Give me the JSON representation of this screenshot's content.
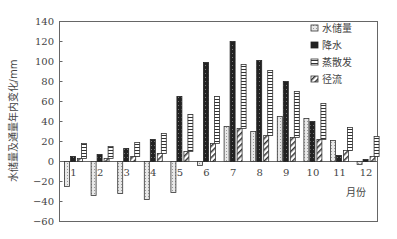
{
  "chart_data": {
    "type": "bar",
    "title": "",
    "xlabel": "月份",
    "ylabel": "水储量及通量年内变化/mm",
    "ylim": [
      -60,
      140
    ],
    "yticks": [
      140,
      120,
      100,
      80,
      60,
      40,
      20,
      0,
      -20,
      -40,
      -60
    ],
    "grid": false,
    "legend_position": "upper right",
    "categories": [
      "1",
      "2",
      "3",
      "4",
      "5",
      "6",
      "7",
      "8",
      "9",
      "10",
      "11",
      "12"
    ],
    "series": [
      {
        "name": "水储量",
        "pattern": "dotted-light",
        "values": [
          -25,
          -34,
          -32,
          -38,
          -31,
          -4,
          35,
          30,
          45,
          43,
          21,
          -3
        ]
      },
      {
        "name": "降水",
        "pattern": "dark",
        "values": [
          5,
          7,
          13,
          22,
          65,
          99,
          120,
          101,
          80,
          40,
          6,
          2
        ]
      },
      {
        "name": "蒸散发",
        "pattern": "horizontal-lines",
        "base": "stacked-on-径流",
        "values": [
          15,
          12,
          14,
          20,
          37,
          47,
          64,
          65,
          46,
          36,
          23,
          20
        ]
      },
      {
        "name": "径流",
        "pattern": "diagonal-hatch",
        "values": [
          3,
          3,
          5,
          8,
          10,
          18,
          33,
          26,
          24,
          22,
          11,
          5
        ]
      }
    ]
  },
  "legend": {
    "items": [
      {
        "label": "水储量"
      },
      {
        "label": "降水"
      },
      {
        "label": "蒸散发"
      },
      {
        "label": "径流"
      }
    ]
  },
  "axes": {
    "x_title": "月份",
    "y_title": "水储量及通量年内变化/mm"
  }
}
